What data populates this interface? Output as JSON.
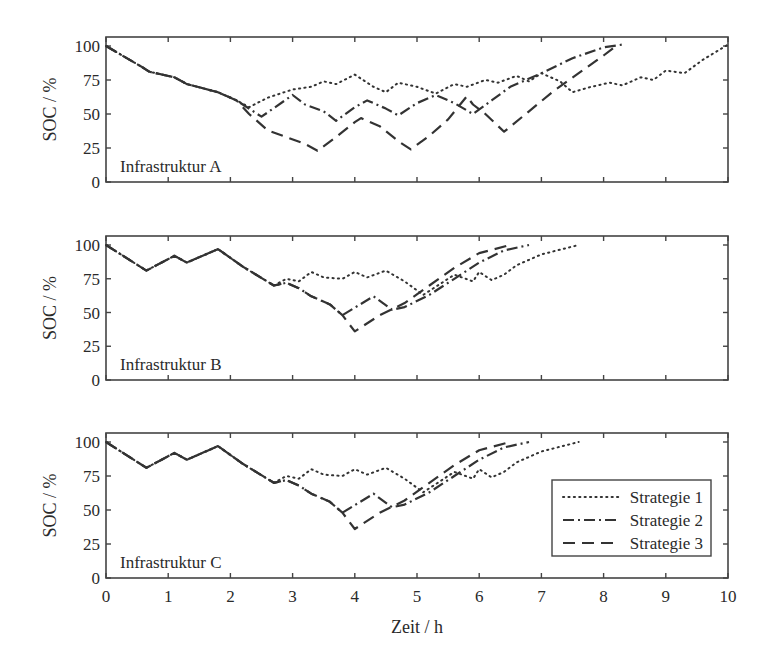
{
  "chart_data": [
    {
      "type": "line",
      "title": "",
      "panel_label": "Infrastruktur A",
      "xlabel": "",
      "ylabel": "SOC / %",
      "xlim": [
        0,
        10
      ],
      "ylim": [
        0,
        100
      ],
      "xticks": [
        0,
        1,
        2,
        3,
        4,
        5,
        6,
        7,
        8,
        9,
        10
      ],
      "yticks": [
        0,
        25,
        50,
        75,
        100
      ],
      "grid": false,
      "series": [
        {
          "name": "Strategie 1",
          "style": "dotted",
          "x": [
            0,
            0.6,
            0.7,
            1.1,
            1.3,
            1.8,
            2.1,
            2.3,
            2.6,
            3.0,
            3.3,
            3.5,
            3.7,
            4.0,
            4.3,
            4.5,
            4.7,
            5.0,
            5.3,
            5.6,
            5.8,
            6.1,
            6.3,
            6.6,
            6.8,
            7.0,
            7.3,
            7.5,
            7.8,
            8.1,
            8.3,
            8.6,
            8.8,
            9.0,
            9.3,
            9.6,
            10.0
          ],
          "y": [
            100,
            84,
            81,
            77,
            72,
            66,
            60,
            55,
            62,
            68,
            70,
            74,
            72,
            79,
            70,
            66,
            73,
            70,
            65,
            72,
            70,
            75,
            73,
            78,
            74,
            80,
            74,
            66,
            70,
            73,
            71,
            77,
            75,
            82,
            80,
            90,
            101
          ]
        },
        {
          "name": "Strategie 2",
          "style": "dashdot",
          "x": [
            0,
            0.6,
            0.7,
            1.1,
            1.3,
            1.8,
            2.1,
            2.5,
            3.0,
            3.2,
            3.5,
            3.7,
            4.0,
            4.2,
            4.5,
            4.7,
            5.0,
            5.3,
            5.6,
            5.9,
            6.2,
            6.5,
            7.0,
            7.5,
            8.0,
            8.3
          ],
          "y": [
            100,
            84,
            81,
            77,
            72,
            66,
            60,
            48,
            64,
            57,
            52,
            45,
            55,
            60,
            54,
            49,
            58,
            64,
            58,
            50,
            60,
            70,
            80,
            91,
            99,
            101
          ]
        },
        {
          "name": "Strategie 3",
          "style": "dashed",
          "x": [
            0,
            0.6,
            0.7,
            1.1,
            1.3,
            1.8,
            2.1,
            2.3,
            2.6,
            2.9,
            3.2,
            3.4,
            3.7,
            4.0,
            4.1,
            4.4,
            4.7,
            4.9,
            5.2,
            5.5,
            5.8,
            5.9,
            6.1,
            6.4,
            6.8,
            7.2,
            7.6,
            8.0,
            8.2
          ],
          "y": [
            100,
            84,
            81,
            77,
            72,
            66,
            60,
            50,
            38,
            33,
            28,
            23,
            33,
            44,
            47,
            41,
            30,
            24,
            34,
            46,
            63,
            57,
            50,
            37,
            52,
            67,
            80,
            93,
            100
          ]
        }
      ]
    },
    {
      "type": "line",
      "title": "",
      "panel_label": "Infrastruktur B",
      "xlabel": "",
      "ylabel": "SOC / %",
      "xlim": [
        0,
        10
      ],
      "ylim": [
        0,
        100
      ],
      "xticks": [
        0,
        1,
        2,
        3,
        4,
        5,
        6,
        7,
        8,
        9,
        10
      ],
      "yticks": [
        0,
        25,
        50,
        75,
        100
      ],
      "grid": false,
      "series": [
        {
          "name": "Strategie 1",
          "style": "dotted",
          "x": [
            0,
            0.65,
            1.1,
            1.3,
            1.8,
            2.2,
            2.7,
            2.9,
            3.1,
            3.3,
            3.5,
            3.8,
            4.0,
            4.2,
            4.5,
            4.8,
            5.1,
            5.4,
            5.6,
            5.9,
            6.0,
            6.2,
            6.4,
            6.6,
            7.0,
            7.6
          ],
          "y": [
            100,
            81,
            92,
            87,
            97,
            84,
            70,
            75,
            73,
            80,
            76,
            75,
            80,
            76,
            81,
            73,
            63,
            72,
            78,
            73,
            80,
            74,
            78,
            85,
            93,
            100
          ]
        },
        {
          "name": "Strategie 2",
          "style": "dashdot",
          "x": [
            0,
            0.65,
            1.1,
            1.3,
            1.8,
            2.2,
            2.7,
            2.9,
            3.1,
            3.3,
            3.6,
            3.8,
            4.3,
            4.6,
            4.8,
            5.2,
            5.6,
            6.0,
            6.4,
            6.8
          ],
          "y": [
            100,
            81,
            92,
            87,
            97,
            84,
            70,
            72,
            68,
            62,
            56,
            48,
            62,
            52,
            54,
            63,
            75,
            87,
            96,
            100
          ]
        },
        {
          "name": "Strategie 3",
          "style": "dashed",
          "x": [
            0,
            0.65,
            1.1,
            1.3,
            1.8,
            2.2,
            2.7,
            2.9,
            3.1,
            3.3,
            3.6,
            3.8,
            4.0,
            4.4,
            4.8,
            5.2,
            5.6,
            6.0,
            6.5
          ],
          "y": [
            100,
            81,
            92,
            87,
            97,
            84,
            70,
            72,
            68,
            62,
            56,
            48,
            36,
            48,
            57,
            70,
            83,
            94,
            100
          ]
        }
      ]
    },
    {
      "type": "line",
      "title": "",
      "panel_label": "Infrastruktur C",
      "xlabel": "Zeit / h",
      "ylabel": "SOC / %",
      "xlim": [
        0,
        10
      ],
      "ylim": [
        0,
        100
      ],
      "xticks": [
        0,
        1,
        2,
        3,
        4,
        5,
        6,
        7,
        8,
        9,
        10
      ],
      "yticks": [
        0,
        25,
        50,
        75,
        100
      ],
      "grid": false,
      "legend": {
        "position": "lower right",
        "entries": [
          "Strategie 1",
          "Strategie 2",
          "Strategie 3"
        ]
      },
      "series": [
        {
          "name": "Strategie 1",
          "style": "dotted",
          "x": [
            0,
            0.65,
            1.1,
            1.3,
            1.8,
            2.2,
            2.7,
            2.9,
            3.1,
            3.3,
            3.5,
            3.8,
            4.0,
            4.2,
            4.5,
            4.8,
            5.1,
            5.4,
            5.6,
            5.9,
            6.0,
            6.2,
            6.4,
            6.6,
            7.0,
            7.6
          ],
          "y": [
            100,
            81,
            92,
            87,
            97,
            84,
            70,
            75,
            73,
            80,
            76,
            75,
            80,
            76,
            81,
            73,
            63,
            72,
            78,
            73,
            80,
            74,
            78,
            85,
            93,
            100
          ]
        },
        {
          "name": "Strategie 2",
          "style": "dashdot",
          "x": [
            0,
            0.65,
            1.1,
            1.3,
            1.8,
            2.2,
            2.7,
            2.9,
            3.1,
            3.3,
            3.6,
            3.8,
            4.3,
            4.6,
            4.8,
            5.2,
            5.6,
            6.0,
            6.4,
            6.8
          ],
          "y": [
            100,
            81,
            92,
            87,
            97,
            84,
            70,
            72,
            68,
            62,
            56,
            48,
            62,
            52,
            54,
            63,
            75,
            87,
            96,
            100
          ]
        },
        {
          "name": "Strategie 3",
          "style": "dashed",
          "x": [
            0,
            0.65,
            1.1,
            1.3,
            1.8,
            2.2,
            2.7,
            2.9,
            3.1,
            3.3,
            3.6,
            3.8,
            4.0,
            4.4,
            4.8,
            5.2,
            5.6,
            6.0,
            6.5
          ],
          "y": [
            100,
            81,
            92,
            87,
            97,
            84,
            70,
            72,
            68,
            62,
            56,
            48,
            36,
            48,
            57,
            70,
            83,
            94,
            100
          ]
        }
      ]
    }
  ],
  "labels": {
    "ylabel": "SOC / %",
    "xlabel": "Zeit / h",
    "panels": [
      "Infrastruktur A",
      "Infrastruktur B",
      "Infrastruktur C"
    ],
    "legend": [
      "Strategie 1",
      "Strategie 2",
      "Strategie 3"
    ],
    "xticks": [
      "0",
      "1",
      "2",
      "3",
      "4",
      "5",
      "6",
      "7",
      "8",
      "9",
      "10"
    ],
    "yticks": [
      "0",
      "25",
      "50",
      "75",
      "100"
    ]
  },
  "colors": {
    "line": "#333333",
    "frame": "#444444",
    "background": "#ffffff"
  }
}
